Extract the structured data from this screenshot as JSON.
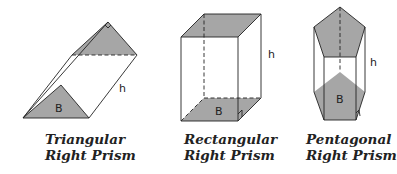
{
  "colors": {
    "face_fill": "#a6a6a6",
    "stroke": "#222222"
  },
  "figures": [
    {
      "name": "triangular",
      "base_label": "B",
      "height_label": "h",
      "caption_line1": "Triangular",
      "caption_line2": "Right Prism"
    },
    {
      "name": "rectangular",
      "base_label": "B",
      "height_label": "h",
      "caption_line1": "Rectangular",
      "caption_line2": "Right Prism"
    },
    {
      "name": "pentagonal",
      "base_label": "B",
      "height_label": "h",
      "caption_line1": "Pentagonal",
      "caption_line2": "Right Prism"
    }
  ]
}
